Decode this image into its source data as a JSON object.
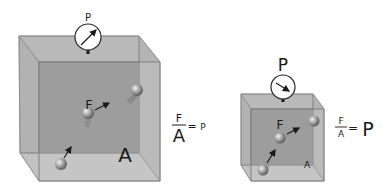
{
  "diagram": {
    "left": {
      "gauge_label": "P",
      "force_label": "F",
      "area_label": "A",
      "equation": {
        "numerator": "F",
        "denominator": "A",
        "equals": "=",
        "result": "P"
      }
    },
    "right": {
      "gauge_label": "P",
      "force_label": "F",
      "area_label": "A",
      "equation": {
        "numerator": "F",
        "denominator": "A",
        "equals": "=",
        "result": "P"
      }
    }
  },
  "colors": {
    "box_face": "#a8a8a8",
    "box_back": "#8f8f8f",
    "box_edge": "#7a7a7a",
    "ball": "#9a9a9a",
    "text": "#1a1a1a"
  }
}
